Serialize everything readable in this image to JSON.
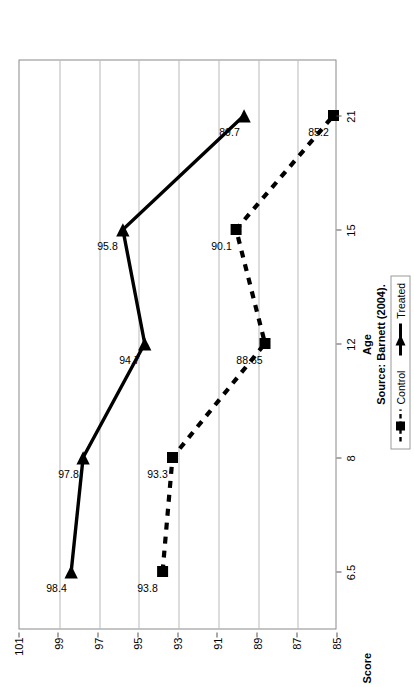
{
  "chart_data": {
    "type": "line",
    "title": "",
    "xlabel": "Age",
    "ylabel": "Score",
    "categories": [
      "6.5",
      "8",
      "12",
      "15",
      "21"
    ],
    "ylim": [
      85,
      101
    ],
    "yticks": [
      "101",
      "99",
      "97",
      "95",
      "93",
      "91",
      "89",
      "87",
      "85"
    ],
    "grid": true,
    "orientation": "rotated-90-ccw",
    "legend_position": "right-middle",
    "series": [
      {
        "name": "Control",
        "marker": "square",
        "line_style": "dashed",
        "color": "#000000",
        "values": [
          93.8,
          93.3,
          88.65,
          90.1,
          85.2
        ],
        "point_labels": [
          "93.8",
          "93.3",
          "88.65",
          "90.1",
          "85.2"
        ]
      },
      {
        "name": "Treated",
        "marker": "triangle",
        "line_style": "solid",
        "color": "#000000",
        "values": [
          98.4,
          97.8,
          94.7,
          95.8,
          89.7
        ],
        "point_labels": [
          "98.4",
          "97.8",
          "94.7",
          "95.8",
          "89.7"
        ]
      }
    ],
    "annotations": [
      "Source: Barnett (2004)."
    ]
  },
  "axes": {
    "value_axis_title": "Score",
    "category_axis_title": "Age"
  },
  "source": {
    "text": "Source: Barnett (2004)."
  },
  "legend": {
    "items": [
      {
        "label": "Control"
      },
      {
        "label": "Treated"
      }
    ]
  },
  "colors": {
    "series": "#000000",
    "grid": "#b9b9b9",
    "axis": "#8a8a8a",
    "background": "#ffffff"
  }
}
